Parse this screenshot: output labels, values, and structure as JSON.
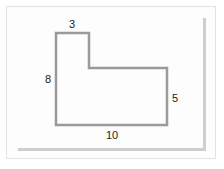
{
  "diagram": {
    "type": "L-shaped polygon with labeled side lengths",
    "stroke_color": "#9a9a9a",
    "labels": {
      "top": "3",
      "left": "8",
      "right": "5",
      "bottom": "10"
    }
  }
}
